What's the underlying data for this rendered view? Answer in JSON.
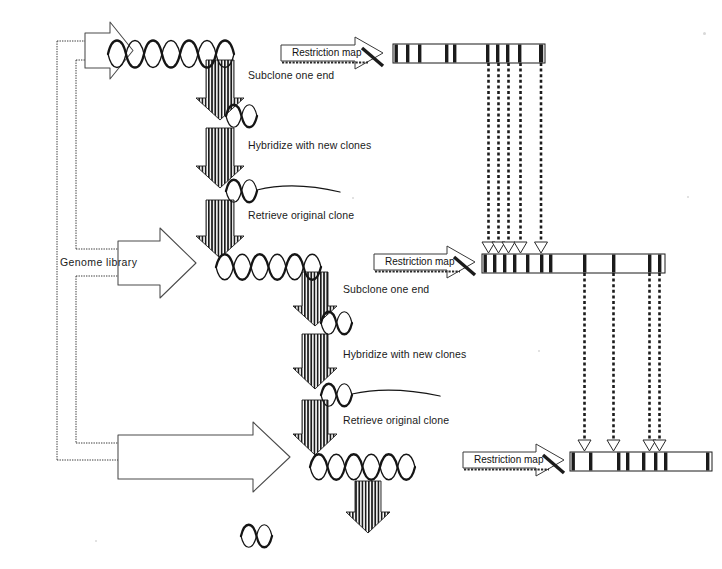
{
  "diagram": {
    "type": "flow-diagram",
    "background_color": "#ffffff",
    "ink_color": "#111111"
  },
  "labels": {
    "genome_library": "Genome  library",
    "restriction_map": "Restriction map",
    "subclone_one_end": "Subclone one end",
    "hybridize_with_new_clones": "Hybridize with new clones",
    "retrieve_original_clone": "Retrieve original clone"
  },
  "rounds": [
    {
      "id": "round-1",
      "helix_label": "genomic-clone-helix-1",
      "steps": [
        {
          "arrow": "down-arrow-1",
          "label": "Subclone one end"
        },
        {
          "arrow": "down-arrow-2",
          "label": "Hybridize with new clones"
        },
        {
          "arrow": "down-arrow-3",
          "label": "Retrieve original clone"
        }
      ],
      "restriction_map_label": "Restriction map"
    },
    {
      "id": "round-2",
      "helix_label": "genomic-clone-helix-2",
      "steps": [
        {
          "arrow": "down-arrow-4",
          "label": "Subclone one end"
        },
        {
          "arrow": "down-arrow-5",
          "label": "Hybridize with new clones"
        },
        {
          "arrow": "down-arrow-6",
          "label": "Retrieve original clone"
        }
      ],
      "restriction_map_label": "Restriction map"
    },
    {
      "id": "round-3",
      "helix_label": "genomic-clone-helix-3",
      "steps": [
        {
          "arrow": "down-arrow-7",
          "label": ""
        }
      ],
      "restriction_map_label": "Restriction map"
    }
  ],
  "restriction_maps": [
    {
      "id": "restriction-map-1",
      "x": 393,
      "y": 44,
      "width": 152,
      "height": 19,
      "bands": [
        2,
        14,
        26,
        54,
        62,
        96,
        106,
        116,
        128,
        148
      ]
    },
    {
      "id": "restriction-map-2",
      "x": 482,
      "y": 254,
      "width": 183,
      "height": 19,
      "bands": [
        2,
        12,
        22,
        32,
        46,
        60,
        68,
        103,
        132,
        168,
        178
      ]
    },
    {
      "id": "restriction-map-3",
      "x": 570,
      "y": 452,
      "width": 142,
      "height": 19,
      "bands": [
        2,
        20,
        48,
        58,
        74,
        86,
        96,
        138
      ]
    }
  ],
  "dotted_connectors": [
    {
      "id": "connector-group-1",
      "from_map": "restriction-map-1",
      "to_map": "restriction-map-2",
      "lines": [
        {
          "x": 489,
          "y1": 63,
          "y2": 248
        },
        {
          "x": 499,
          "y1": 63,
          "y2": 248
        },
        {
          "x": 509,
          "y1": 63,
          "y2": 248
        },
        {
          "x": 521,
          "y1": 63,
          "y2": 248
        },
        {
          "x": 541,
          "y1": 63,
          "y2": 248
        }
      ]
    },
    {
      "id": "connector-group-2",
      "from_map": "restriction-map-2",
      "to_map": "restriction-map-3",
      "lines": [
        {
          "x": 585,
          "y1": 273,
          "y2": 446
        },
        {
          "x": 614,
          "y1": 273,
          "y2": 446
        },
        {
          "x": 650,
          "y1": 273,
          "y2": 446
        },
        {
          "x": 660,
          "y1": 273,
          "y2": 446
        }
      ]
    }
  ],
  "helices": [
    {
      "id": "helix-full-1",
      "x": 108,
      "y": 34,
      "turns": 7,
      "width": 126,
      "kind": "full-length-clone"
    },
    {
      "id": "helix-small-1",
      "x": 227,
      "y": 103,
      "turns": 1,
      "width": 22,
      "kind": "subclone-end"
    },
    {
      "id": "helix-probe-1",
      "x": 227,
      "y": 178,
      "turns": 1,
      "width": 22,
      "kind": "subclone-end-with-tail"
    },
    {
      "id": "helix-full-2",
      "x": 218,
      "y": 250,
      "turns": 6,
      "width": 110,
      "kind": "full-length-clone"
    },
    {
      "id": "helix-small-2",
      "x": 322,
      "y": 310,
      "turns": 1,
      "width": 22,
      "kind": "subclone-end"
    },
    {
      "id": "helix-probe-2",
      "x": 322,
      "y": 383,
      "turns": 1,
      "width": 22,
      "kind": "subclone-end-with-tail"
    },
    {
      "id": "helix-full-3",
      "x": 312,
      "y": 450,
      "turns": 6,
      "width": 110,
      "kind": "full-length-clone"
    },
    {
      "id": "helix-small-3",
      "x": 242,
      "y": 523,
      "turns": 1,
      "width": 22,
      "kind": "subclone-end"
    }
  ],
  "block_arrows": [
    {
      "id": "genome-library-arrow-top",
      "direction": "right",
      "x": 55,
      "y": 26,
      "target": "helix-full-1"
    },
    {
      "id": "genome-library-arrow-middle",
      "direction": "right",
      "x": 55,
      "y": 238,
      "target": "helix-full-2"
    },
    {
      "id": "genome-library-arrow-bottom",
      "direction": "right",
      "x": 55,
      "y": 432,
      "target": "helix-full-3"
    }
  ]
}
